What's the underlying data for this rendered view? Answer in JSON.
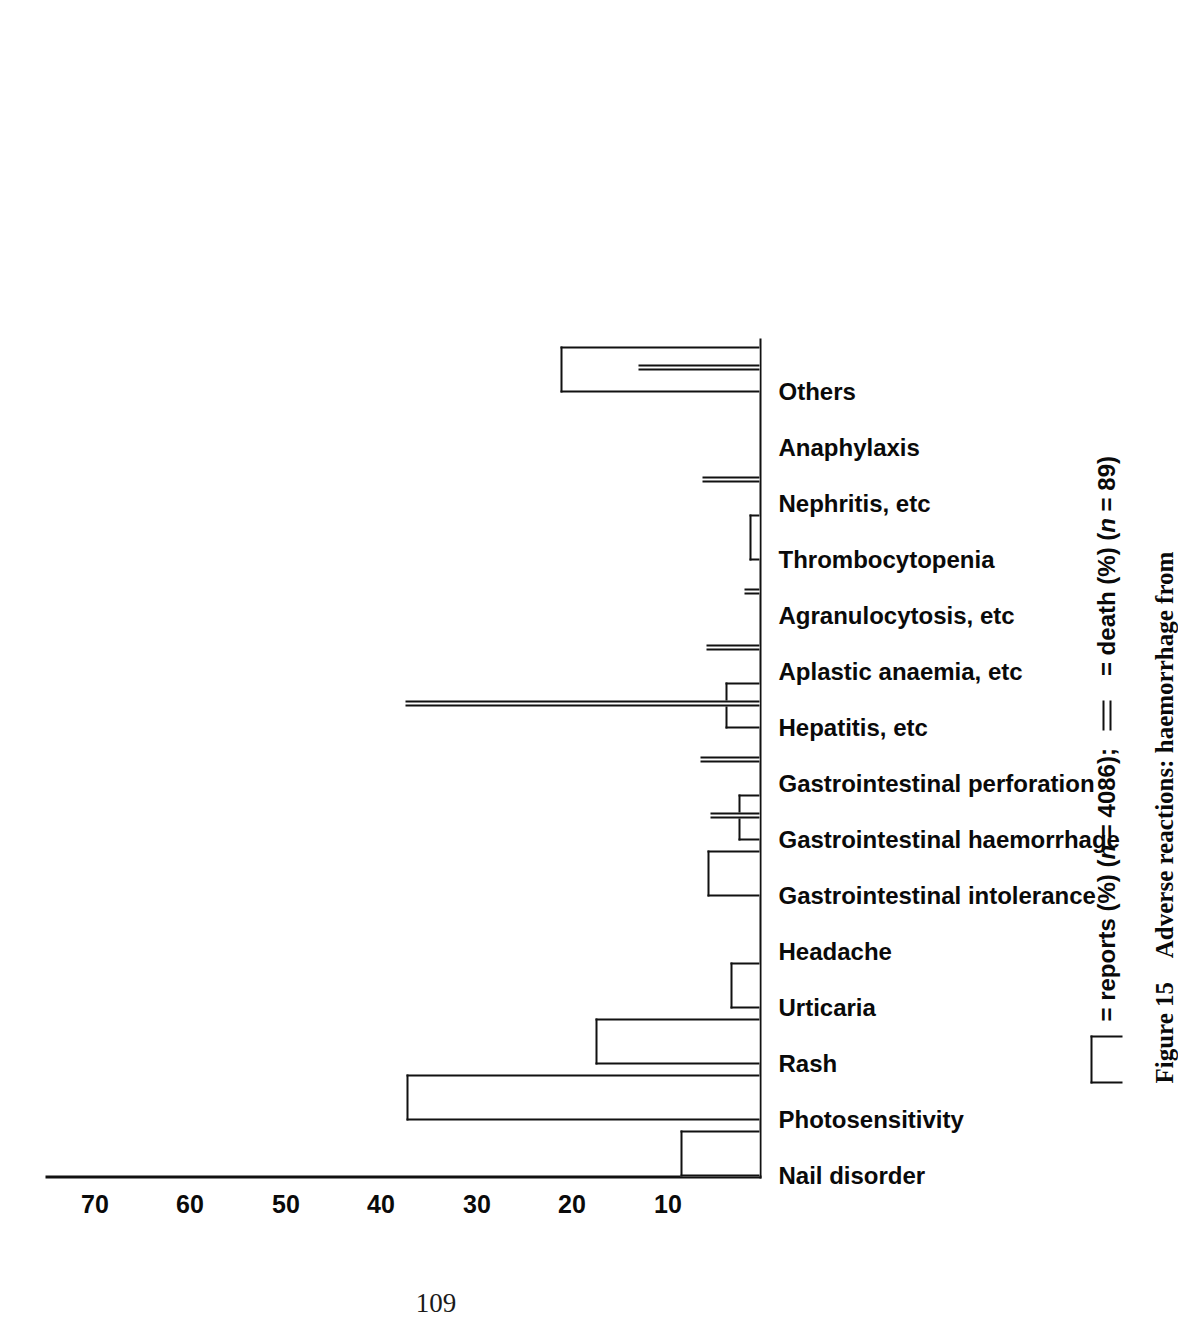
{
  "page": {
    "folio": "109"
  },
  "figure": {
    "caption_prefix": "Figure 15",
    "caption_text": "Adverse reactions: haemorrhage from"
  },
  "legend": {
    "items": [
      {
        "swatch": "open-box",
        "label": "= reports (%) (",
        "italic_n": "n",
        "tail": " = 4086);"
      },
      {
        "swatch": "double-line",
        "label": "= death (%) (",
        "italic_n": "n",
        "tail": " = 89)"
      }
    ]
  },
  "chart_data": {
    "type": "bar",
    "title": "",
    "xlabel": "",
    "ylabel": "",
    "orientation": "vertical-rotated",
    "grid": false,
    "ylim": [
      0,
      75
    ],
    "yticks": [
      10,
      20,
      30,
      40,
      50,
      60,
      70
    ],
    "ytick_labels": [
      "10",
      "20",
      "30",
      "40",
      "50",
      "60",
      "70"
    ],
    "categories": [
      "Nail disorder",
      "Photosensitivity",
      "Rash",
      "Urticaria",
      "Headache",
      "Gastrointestinal intolerance",
      "Gastrointestinal haemorrhage",
      "Gastrointestinal perforation",
      "Hepatitis, etc",
      "Aplastic anaemia, etc",
      "Agranulocytosis, etc",
      "Thrombocytopenia",
      "Nephritis, etc",
      "Anaphylaxis",
      "Others"
    ],
    "series": [
      {
        "name": "reports (%) (n = 4086)",
        "style": "open-box",
        "values": [
          8.3,
          37.0,
          17.2,
          3.0,
          0.0,
          5.4,
          2.2,
          0.0,
          3.6,
          0.0,
          0.0,
          1.1,
          0.0,
          0.0,
          20.8
        ]
      },
      {
        "name": "death (%) (n = 89)",
        "style": "double-line",
        "values": [
          0.0,
          0.0,
          0.0,
          0.0,
          0.0,
          0.0,
          5.1,
          6.2,
          37.1,
          5.6,
          1.6,
          0.0,
          6.0,
          0.0,
          12.7
        ]
      }
    ]
  }
}
